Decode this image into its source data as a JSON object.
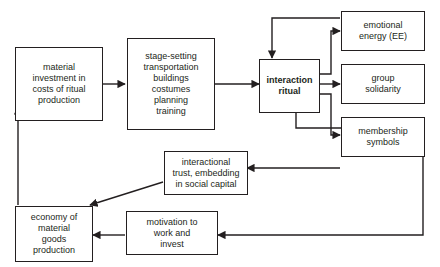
{
  "diagram": {
    "background_color": "#ffffff",
    "line_color": "#231f20",
    "nodes": [
      {
        "id": "material_investment",
        "label": "material\ninvestment in\ncosts of ritual\nproduction",
        "bold": false
      },
      {
        "id": "stage_setting",
        "label": "stage-setting\ntransportation\nbuildings\ncostumes\nplanning\ntraining",
        "bold": false
      },
      {
        "id": "interaction_ritual",
        "label": "interaction\nritual",
        "bold": true
      },
      {
        "id": "emotional_energy",
        "label": "emotional\nenergy (EE)",
        "bold": false
      },
      {
        "id": "group_solidarity",
        "label": "group\nsolidarity",
        "bold": false
      },
      {
        "id": "membership_symbols",
        "label": "membership\nsymbols",
        "bold": false
      },
      {
        "id": "interactional_trust",
        "label": "interactional\ntrust, embedding\nin social capital",
        "bold": false
      },
      {
        "id": "economy_material_goods",
        "label": "economy of\nmaterial\ngoods\nproduction",
        "bold": false
      },
      {
        "id": "motivation_to_work",
        "label": "motivation to\nwork and\ninvest",
        "bold": false
      }
    ],
    "edges": [
      {
        "from": "material_investment",
        "to": "stage_setting"
      },
      {
        "from": "stage_setting",
        "to": "interaction_ritual"
      },
      {
        "from": "interaction_ritual",
        "to": "emotional_energy"
      },
      {
        "from": "interaction_ritual",
        "to": "group_solidarity"
      },
      {
        "from": "interaction_ritual",
        "to": "membership_symbols"
      },
      {
        "from": "emotional_energy",
        "to": "interaction_ritual"
      },
      {
        "from": "membership_symbols",
        "to": "interactional_trust"
      },
      {
        "from": "interactional_trust",
        "to": "economy_material_goods"
      },
      {
        "from": "economy_material_goods",
        "to": "material_investment"
      },
      {
        "from": "motivation_to_work",
        "to": "economy_material_goods"
      },
      {
        "from": "interaction_ritual",
        "to": "motivation_to_work"
      }
    ]
  }
}
